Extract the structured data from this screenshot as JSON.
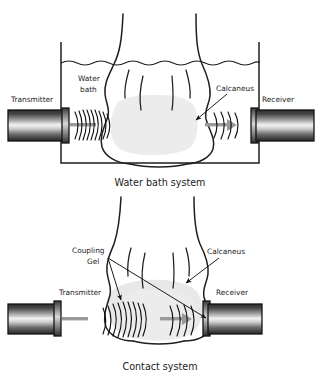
{
  "figure": {
    "background_color": "#ffffff",
    "ink_color": "#1e1e1e",
    "bone_color": "#ececec",
    "beam_color": "#9a9a9a"
  },
  "panels": [
    {
      "id": "water-bath",
      "caption": "Water bath system",
      "labels": {
        "transmitter": "Transmitter",
        "receiver": "Receiver",
        "medium_line1": "Water",
        "medium_line2": "bath",
        "bone": "Calcaneus"
      },
      "transmit_wave_count": 9,
      "receive_wave_count": 4
    },
    {
      "id": "contact",
      "caption": "Contact system",
      "labels": {
        "transmitter": "Transmitter",
        "receiver": "Receiver",
        "medium_line1": "Coupling",
        "medium_line2": "Gel",
        "bone": "Calcaneus"
      },
      "transmit_wave_count": 9,
      "receive_wave_count": 4
    }
  ],
  "icons": {
    "transducer": "transducer-cylinder-icon",
    "wavefront": "ultrasound-wavefront-icon",
    "arrow": "leader-arrow-icon"
  }
}
